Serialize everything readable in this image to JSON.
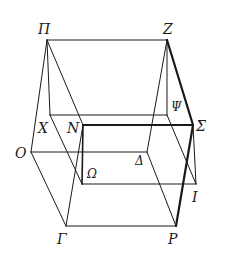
{
  "diagram": {
    "type": "geometric-solid-wireframe",
    "stroke_color": "#1a1a1a",
    "points": {
      "Pi": {
        "label": "Π",
        "x": 47,
        "y": 40
      },
      "Z": {
        "label": "Z",
        "x": 167,
        "y": 40
      },
      "X": {
        "label": "X",
        "x": 50,
        "y": 115
      },
      "Psi": {
        "label": "Ψ",
        "x": 167,
        "y": 115
      },
      "N": {
        "label": "N",
        "x": 83,
        "y": 125
      },
      "Sigma": {
        "label": "Σ",
        "x": 193,
        "y": 125
      },
      "O": {
        "label": "O",
        "x": 31,
        "y": 152
      },
      "Delta": {
        "label": "Δ",
        "x": 147,
        "y": 152
      },
      "Omega": {
        "label": "Ω",
        "x": 82,
        "y": 184
      },
      "I": {
        "label": "I",
        "x": 196,
        "y": 184
      },
      "Gamma": {
        "label": "Γ",
        "x": 66,
        "y": 226
      },
      "P": {
        "label": "P",
        "x": 176,
        "y": 226
      }
    },
    "edges": [
      {
        "from": "Pi",
        "to": "Z",
        "weight": 1
      },
      {
        "from": "Pi",
        "to": "O",
        "weight": 1
      },
      {
        "from": "Pi",
        "to": "X",
        "weight": 1
      },
      {
        "from": "Pi",
        "to": "N",
        "weight": 1
      },
      {
        "from": "Z",
        "to": "Delta",
        "weight": 1
      },
      {
        "from": "Z",
        "to": "Psi",
        "weight": 1
      },
      {
        "from": "Z",
        "to": "Sigma",
        "weight": 2.2
      },
      {
        "from": "X",
        "to": "Psi",
        "weight": 1
      },
      {
        "from": "X",
        "to": "Omega",
        "weight": 1
      },
      {
        "from": "Psi",
        "to": "I",
        "weight": 1
      },
      {
        "from": "N",
        "to": "Sigma",
        "weight": 2.2
      },
      {
        "from": "N",
        "to": "Omega",
        "weight": 1.6
      },
      {
        "from": "Sigma",
        "to": "P",
        "weight": 2.2
      },
      {
        "from": "Sigma",
        "to": "I",
        "weight": 1
      },
      {
        "from": "O",
        "to": "Delta",
        "weight": 1
      },
      {
        "from": "O",
        "to": "Gamma",
        "weight": 1
      },
      {
        "from": "Delta",
        "to": "P",
        "weight": 1
      },
      {
        "from": "Omega",
        "to": "I",
        "weight": 1
      },
      {
        "from": "N",
        "to": "Gamma",
        "weight": 1
      },
      {
        "from": "Gamma",
        "to": "P",
        "weight": 1
      }
    ],
    "labels": [
      {
        "key": "Pi",
        "text": "Π",
        "x": 38,
        "y": 22
      },
      {
        "key": "Z",
        "text": "Z",
        "x": 163,
        "y": 22
      },
      {
        "key": "X",
        "text": "X",
        "x": 38,
        "y": 121
      },
      {
        "key": "N",
        "text": "N",
        "x": 67,
        "y": 121
      },
      {
        "key": "Psi",
        "text": "Ψ",
        "x": 171,
        "y": 101,
        "small": true
      },
      {
        "key": "Sigma",
        "text": "Σ",
        "x": 196,
        "y": 119
      },
      {
        "key": "O",
        "text": "O",
        "x": 15,
        "y": 146
      },
      {
        "key": "Delta",
        "text": "Δ",
        "x": 135,
        "y": 155,
        "small": true
      },
      {
        "key": "Omega",
        "text": "Ω",
        "x": 87,
        "y": 168,
        "small": true
      },
      {
        "key": "I",
        "text": "I",
        "x": 192,
        "y": 190
      },
      {
        "key": "Gamma",
        "text": "Γ",
        "x": 57,
        "y": 232
      },
      {
        "key": "P",
        "text": "P",
        "x": 168,
        "y": 232
      }
    ]
  }
}
